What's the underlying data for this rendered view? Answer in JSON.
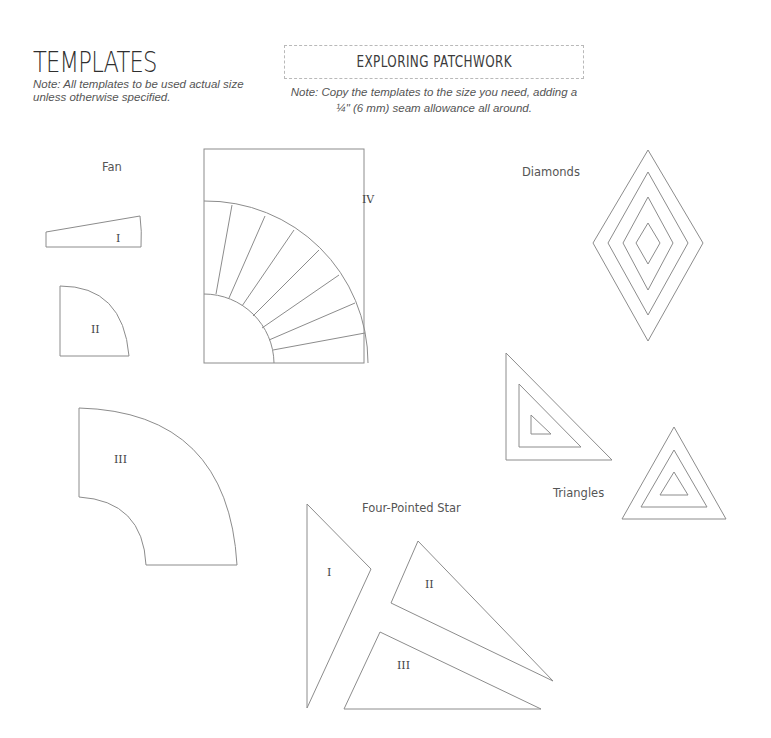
{
  "header": {
    "title": "TEMPLATES",
    "note_left_line1": "Note: All templates to be used actual size",
    "note_left_line2": "unless otherwise specified.",
    "chapter_title": "EXPLORING PATCHWORK",
    "note_right_line1": "Note: Copy the templates to the size you need, adding a",
    "note_right_line2": "¼\" (6 mm) seam allowance all around."
  },
  "sections": {
    "fan": {
      "label": "Fan",
      "pieces": [
        "I",
        "II",
        "III",
        "IV"
      ]
    },
    "diamonds": {
      "label": "Diamonds"
    },
    "triangles": {
      "label": "Triangles"
    },
    "star": {
      "label": "Four-Pointed Star",
      "pieces": [
        "I",
        "II",
        "III"
      ]
    }
  },
  "colors": {
    "line": "#8c8c8c",
    "text": "#3a3a3a",
    "dashed_border": "#b9b9b9"
  }
}
